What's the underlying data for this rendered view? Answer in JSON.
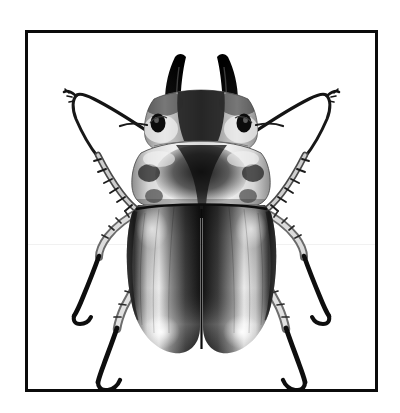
{
  "image": {
    "subject": "stag-beetle",
    "view": "dorsal",
    "rendering": "grayscale-photograph",
    "background_color": "#ffffff",
    "frame_color": "#0b0b0b",
    "frame_border_px": 3,
    "body_tone_dark": "#101010",
    "body_tone_mid": "#8a8a8a",
    "body_tone_light": "#f2f2f2",
    "highlight_color": "#ffffff",
    "artifact": "faint horizontal scan seam",
    "parts": [
      {
        "name": "left-mandible",
        "label": "Left mandible"
      },
      {
        "name": "right-mandible",
        "label": "Right mandible"
      },
      {
        "name": "head",
        "label": "Head"
      },
      {
        "name": "left-eye",
        "label": "Left compound eye"
      },
      {
        "name": "right-eye",
        "label": "Right compound eye"
      },
      {
        "name": "left-antenna",
        "label": "Left antenna"
      },
      {
        "name": "right-antenna",
        "label": "Right antenna"
      },
      {
        "name": "pronotum",
        "label": "Pronotum"
      },
      {
        "name": "scutellum",
        "label": "Scutellum"
      },
      {
        "name": "elytra",
        "label": "Elytra"
      },
      {
        "name": "elytral-suture",
        "label": "Elytral suture"
      },
      {
        "name": "left-foreleg",
        "label": "Left foreleg"
      },
      {
        "name": "right-foreleg",
        "label": "Right foreleg"
      },
      {
        "name": "left-midleg",
        "label": "Left midleg"
      },
      {
        "name": "right-midleg",
        "label": "Right midleg"
      },
      {
        "name": "left-hindleg",
        "label": "Left hindleg"
      },
      {
        "name": "right-hindleg",
        "label": "Right hindleg"
      }
    ]
  }
}
